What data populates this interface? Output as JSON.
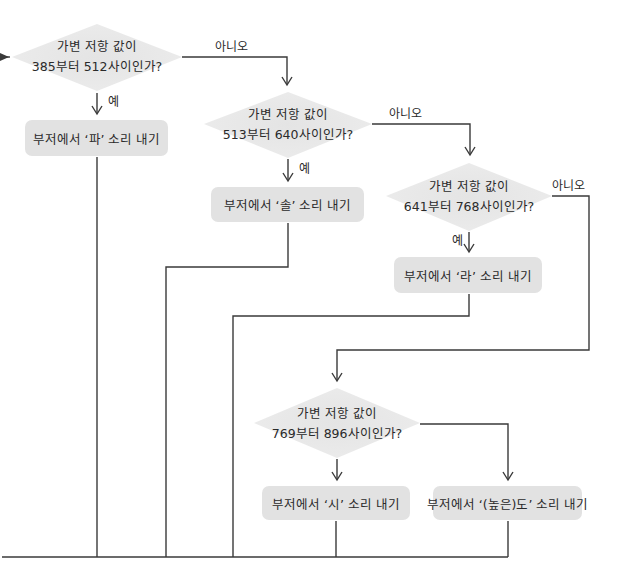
{
  "diagram": {
    "type": "flowchart",
    "colors": {
      "line": "#3a3a3a",
      "shape_fill": "#e2e2e2",
      "diamond_fill": "#e6e6e6",
      "text": "#2a2a2a"
    },
    "decisions": [
      {
        "line1": "가변 저항 값이",
        "line2": "385부터 512사이인가?",
        "yes": "예",
        "no": "아니오"
      },
      {
        "line1": "가변 저항 값이",
        "line2": "513부터 640사이인가?",
        "yes": "예",
        "no": "아니오"
      },
      {
        "line1": "가변 저항 값이",
        "line2": "641부터 768사이인가?",
        "yes": "예",
        "no": "아니오"
      },
      {
        "line1": "가변 저항 값이",
        "line2": "769부터 896사이인가?"
      }
    ],
    "actions": [
      {
        "label": "부저에서 ‘파’ 소리 내기"
      },
      {
        "label": "부저에서 ‘솔’ 소리 내기"
      },
      {
        "label": "부저에서 ‘라’ 소리 내기"
      },
      {
        "label": "부저에서 ‘시’ 소리 내기"
      },
      {
        "label": "부저에서 ‘(높은)도’ 소리 내기"
      }
    ]
  }
}
